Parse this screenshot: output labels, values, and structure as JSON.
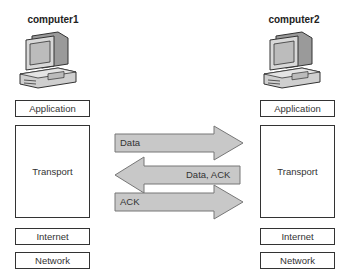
{
  "hosts": [
    {
      "name": "computer1",
      "layers": [
        "Application",
        "Transport",
        "Internet",
        "Network"
      ]
    },
    {
      "name": "computer2",
      "layers": [
        "Application",
        "Transport",
        "Internet",
        "Network"
      ]
    }
  ],
  "messages": [
    {
      "label": "Data",
      "direction": "right"
    },
    {
      "label": "Data, ACK",
      "direction": "left"
    },
    {
      "label": "ACK",
      "direction": "right"
    }
  ],
  "colors": {
    "arrow_fill": "#c8c8c8",
    "arrow_stroke": "#777777",
    "box_border": "#333333"
  }
}
